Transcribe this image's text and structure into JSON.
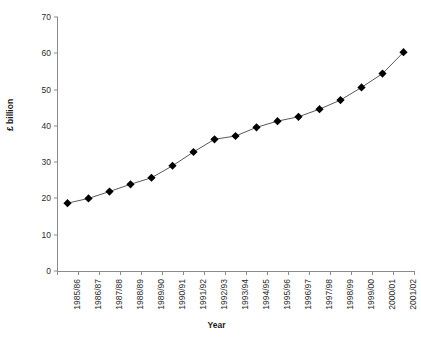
{
  "chart_data": {
    "type": "line",
    "title": "",
    "xlabel": "Year",
    "ylabel": "£ billion",
    "ylim": [
      0,
      70
    ],
    "yticks": [
      0,
      10,
      20,
      30,
      40,
      50,
      60,
      70
    ],
    "grid": false,
    "legend": null,
    "marker": "diamond",
    "marker_color": "#000000",
    "line_color": "#595959",
    "categories": [
      "1985/86",
      "1986/87",
      "1987/88",
      "1988/89",
      "1989/90",
      "1990/91",
      "1991/92",
      "1992/93",
      "1993/94",
      "1994/95",
      "1995/96",
      "1996/97",
      "1997/98",
      "1998/99",
      "1999/00",
      "2000/01",
      "2001/02"
    ],
    "values": [
      18.7,
      20.0,
      21.9,
      23.9,
      25.7,
      29.0,
      32.8,
      36.3,
      37.2,
      39.6,
      41.3,
      42.5,
      44.6,
      47.1,
      50.6,
      54.4,
      60.3
    ]
  }
}
